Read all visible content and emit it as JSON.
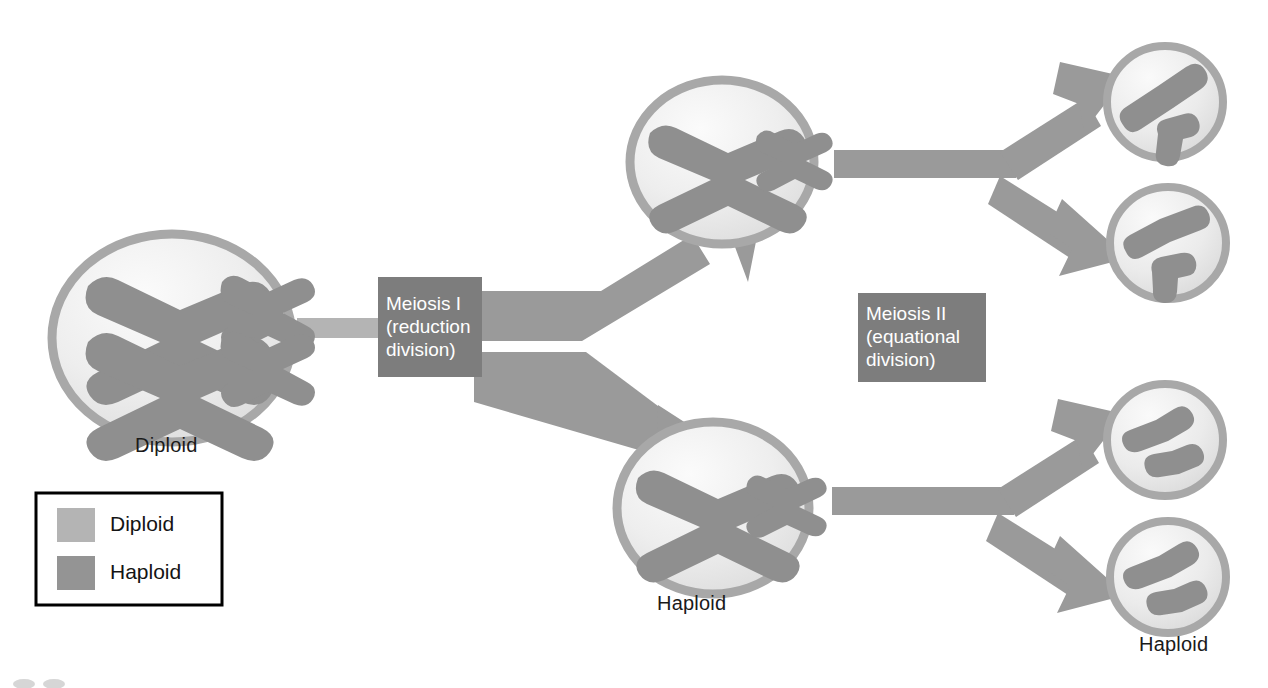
{
  "figure": {
    "background_color": "#ffffff"
  },
  "colors": {
    "diploid_fill": "#b4b4b4",
    "haploid_fill": "#949494",
    "chromosome": "#8f8f8f",
    "membrane": "#a8a8a8",
    "cell_interior": "#ededed",
    "arrow": "#9a9a9a",
    "phase_box": "#7d7d7d",
    "stub": "#b4b4b4",
    "text_dark": "#1a1a1a",
    "text_light": "#ffffff",
    "legend_border": "#000000"
  },
  "phase_boxes": [
    {
      "id": "meiosis-1",
      "line1": "Meiosis I",
      "line2": "(reduction",
      "line3": "division)",
      "x": 378,
      "y": 277,
      "width": 104,
      "height": 100
    },
    {
      "id": "meiosis-2",
      "line1": "Meiosis II",
      "line2": "(equational",
      "line3": "division)",
      "x": 858,
      "y": 293,
      "width": 128,
      "height": 89
    }
  ],
  "cell_labels": [
    {
      "id": "diploid-parent-label",
      "text": "Diploid",
      "x": 168,
      "y": 434
    },
    {
      "id": "haploid-middle-label",
      "text": "Haploid",
      "x": 690,
      "y": 592
    },
    {
      "id": "haploid-daughter-label",
      "text": "Haploid",
      "x": 1172,
      "y": 633
    }
  ],
  "legend": {
    "x": 36,
    "y": 493,
    "width": 186,
    "height": 112,
    "items": [
      {
        "id": "legend-diploid",
        "label": "Diploid",
        "swatch_color": "#b4b4b4"
      },
      {
        "id": "legend-haploid",
        "label": "Haploid",
        "swatch_color": "#949494"
      }
    ]
  },
  "cells": [
    {
      "id": "parent-diploid-cell",
      "ploidy": "diploid",
      "cx": 172,
      "cy": 338,
      "rx": 120,
      "ry": 104,
      "chromosome_count": 4,
      "description": "two large homologous X chromosomes and two small X chromosomes"
    },
    {
      "id": "haploid-cell-upper",
      "ploidy": "haploid",
      "cx": 722,
      "cy": 162,
      "rx": 92,
      "ry": 82,
      "chromosome_count": 2,
      "description": "one large X chromosome and one small X chromosome"
    },
    {
      "id": "haploid-cell-lower",
      "ploidy": "haploid",
      "cx": 713,
      "cy": 508,
      "rx": 96,
      "ry": 86,
      "chromosome_count": 2,
      "description": "one large X chromosome and one small X chromosome"
    },
    {
      "id": "daughter-cell-1",
      "ploidy": "haploid",
      "cx": 1165,
      "cy": 102,
      "rx": 58,
      "ry": 56,
      "chromosome_count": 2,
      "description": "one long chromatid and one short bent chromatid"
    },
    {
      "id": "daughter-cell-2",
      "ploidy": "haploid",
      "cx": 1168,
      "cy": 243,
      "rx": 58,
      "ry": 56,
      "chromosome_count": 2,
      "description": "one long chromatid and one short bent chromatid"
    },
    {
      "id": "daughter-cell-3",
      "ploidy": "haploid",
      "cx": 1165,
      "cy": 440,
      "rx": 58,
      "ry": 56,
      "chromosome_count": 2,
      "description": "one long chromatid and one short bent chromatid"
    },
    {
      "id": "daughter-cell-4",
      "ploidy": "haploid",
      "cx": 1168,
      "cy": 577,
      "rx": 58,
      "ry": 56,
      "chromosome_count": 2,
      "description": "one long chromatid and one short bent chromatid"
    }
  ],
  "arrows": [
    {
      "id": "arrow-meiosis1-up",
      "from": "meiosis-1",
      "to": "haploid-cell-upper"
    },
    {
      "id": "arrow-meiosis1-down",
      "from": "meiosis-1",
      "to": "haploid-cell-lower"
    },
    {
      "id": "arrow-meiosis2-upper-top",
      "from": "haploid-cell-upper",
      "to": "daughter-cell-1"
    },
    {
      "id": "arrow-meiosis2-upper-bottom",
      "from": "haploid-cell-upper",
      "to": "daughter-cell-2"
    },
    {
      "id": "arrow-meiosis2-lower-top",
      "from": "haploid-cell-lower",
      "to": "daughter-cell-3"
    },
    {
      "id": "arrow-meiosis2-lower-bottom",
      "from": "haploid-cell-lower",
      "to": "daughter-cell-4"
    }
  ],
  "connector": {
    "id": "parent-to-meiosis1-stub",
    "x": 297,
    "y": 318,
    "width": 84,
    "height": 20
  }
}
